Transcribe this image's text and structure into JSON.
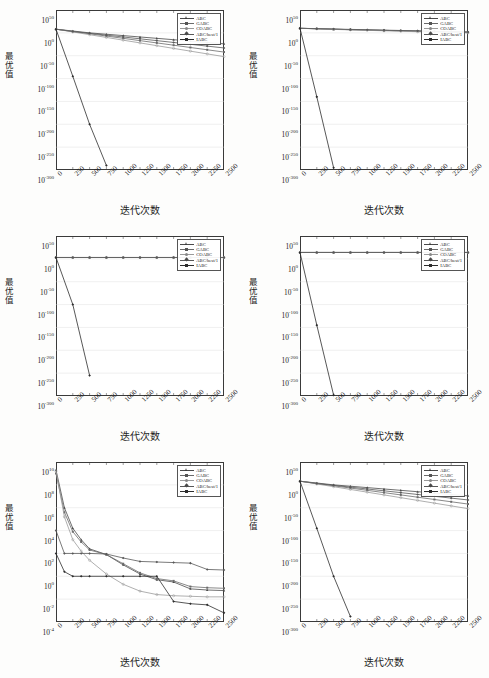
{
  "figure": {
    "axis_labels": {
      "x": "迭代次数",
      "y": "最优值"
    },
    "legend_entries": [
      "ABC",
      "GABC",
      "COABC",
      "ABC/best/1",
      "IABC"
    ],
    "x_ticks": [
      "0",
      "250",
      "500",
      "750",
      "1000",
      "1250",
      "1500",
      "1750",
      "2000",
      "2250",
      "2500"
    ],
    "y_ticks_wide": [
      "10",
      "10",
      "10",
      "10",
      "10",
      "10",
      "10",
      "10"
    ],
    "y_exponents_wide": [
      "50",
      "0",
      "-50",
      "-100",
      "-150",
      "-200",
      "-250",
      "-300"
    ],
    "y_ticks_narrow": [
      "10",
      "10",
      "10",
      "10",
      "10",
      "10",
      "10",
      "10"
    ],
    "y_exponents_narrow": [
      "10",
      "8",
      "6",
      "4",
      "2",
      "0",
      "-2",
      "-4"
    ]
  },
  "chart_data": [
    {
      "type": "line",
      "panel": "top-left",
      "title": "",
      "xlabel": "迭代次数",
      "ylabel": "最优值",
      "xlim": [
        0,
        2500
      ],
      "ylim_log10": [
        -300,
        50
      ],
      "x": [
        0,
        250,
        500,
        750,
        1000,
        1250,
        1500,
        1750,
        2000,
        2250,
        2500
      ],
      "series": [
        {
          "name": "ABC",
          "log10_values": [
            8,
            4,
            0,
            -3,
            -6,
            -9,
            -12,
            -15,
            -18,
            -21,
            -24
          ]
        },
        {
          "name": "GABC",
          "log10_values": [
            8,
            3,
            -2,
            -7,
            -12,
            -17,
            -22,
            -27,
            -32,
            -37,
            -42
          ]
        },
        {
          "name": "COABC",
          "log10_values": [
            8,
            2,
            -4,
            -10,
            -16,
            -22,
            -28,
            -34,
            -40,
            -46,
            -52
          ]
        },
        {
          "name": "ABC/best/1",
          "log10_values": [
            8,
            3,
            -1,
            -5,
            -9,
            -13,
            -17,
            -21,
            -25,
            -29,
            -33
          ]
        },
        {
          "name": "IABC",
          "log10_values": [
            8,
            -95,
            -200,
            -290,
            null,
            null,
            null,
            null,
            null,
            null,
            null
          ]
        }
      ]
    },
    {
      "type": "line",
      "panel": "top-right",
      "title": "",
      "xlabel": "迭代次数",
      "ylabel": "最优值",
      "xlim": [
        0,
        2500
      ],
      "ylim_log10": [
        -300,
        50
      ],
      "x": [
        0,
        250,
        500,
        750,
        1000,
        1250,
        1500,
        1750,
        2000,
        2250,
        2500
      ],
      "series": [
        {
          "name": "ABC",
          "log10_values": [
            10,
            9,
            8,
            7,
            6.2,
            5.4,
            4.6,
            3.8,
            3.0,
            2.2,
            1.4
          ]
        },
        {
          "name": "GABC",
          "log10_values": [
            10,
            9,
            8,
            7,
            6.2,
            5.4,
            4.6,
            3.8,
            3.0,
            2.2,
            1.4
          ]
        },
        {
          "name": "COABC",
          "log10_values": [
            10,
            8.8,
            7.6,
            6.5,
            5.5,
            4.5,
            3.5,
            2.5,
            1.6,
            0.8,
            0.0
          ]
        },
        {
          "name": "ABC/best/1",
          "log10_values": [
            10,
            9.2,
            8.4,
            7.6,
            6.8,
            6.0,
            5.2,
            4.4,
            3.6,
            2.8,
            2.0
          ]
        },
        {
          "name": "IABC",
          "log10_values": [
            10,
            -140,
            -295,
            null,
            null,
            null,
            null,
            null,
            null,
            null,
            null
          ]
        }
      ]
    },
    {
      "type": "line",
      "panel": "middle-left",
      "title": "",
      "xlabel": "迭代次数",
      "ylabel": "最优值",
      "xlim": [
        0,
        2500
      ],
      "ylim_log10": [
        -300,
        50
      ],
      "x": [
        0,
        250,
        500,
        750,
        1000,
        1250,
        1500,
        1750,
        2000,
        2250,
        2500
      ],
      "series": [
        {
          "name": "ABC",
          "log10_values": [
            3,
            3,
            3,
            3,
            3,
            3,
            3,
            3,
            3,
            3,
            3
          ]
        },
        {
          "name": "GABC",
          "log10_values": [
            3,
            3,
            3,
            3,
            3,
            3,
            3,
            3,
            3,
            3,
            3
          ]
        },
        {
          "name": "COABC",
          "log10_values": [
            3,
            3,
            3,
            3,
            3,
            3,
            3,
            3,
            3,
            3,
            3
          ]
        },
        {
          "name": "ABC/best/1",
          "log10_values": [
            3,
            3,
            3,
            3,
            3,
            3,
            3,
            3,
            3,
            3,
            3
          ]
        },
        {
          "name": "IABC",
          "log10_values": [
            3,
            -100,
            -255,
            null,
            null,
            null,
            null,
            null,
            null,
            null,
            null
          ]
        }
      ]
    },
    {
      "type": "line",
      "panel": "middle-right",
      "title": "",
      "xlabel": "迭代次数",
      "ylabel": "最优值",
      "xlim": [
        0,
        2500
      ],
      "ylim_log10": [
        -300,
        50
      ],
      "x": [
        0,
        250,
        500,
        750,
        1000,
        1250,
        1500,
        1750,
        2000,
        2250,
        2500
      ],
      "series": [
        {
          "name": "ABC",
          "log10_values": [
            14,
            14,
            14,
            14,
            14,
            14,
            14,
            14,
            14,
            14,
            14
          ]
        },
        {
          "name": "GABC",
          "log10_values": [
            14,
            14,
            14,
            14,
            14,
            14,
            14,
            14,
            14,
            14,
            14
          ]
        },
        {
          "name": "COABC",
          "log10_values": [
            14,
            14,
            14,
            14,
            14,
            14,
            14,
            14,
            14,
            14,
            14
          ]
        },
        {
          "name": "ABC/best/1",
          "log10_values": [
            14,
            14,
            14,
            14,
            14,
            14,
            14,
            14,
            14,
            14,
            14
          ]
        },
        {
          "name": "IABC",
          "log10_values": [
            14,
            -145,
            -298,
            null,
            null,
            null,
            null,
            null,
            null,
            null,
            null
          ]
        }
      ]
    },
    {
      "type": "line",
      "panel": "bottom-left",
      "title": "",
      "xlabel": "迭代次数",
      "ylabel": "最优值",
      "xlim": [
        0,
        2500
      ],
      "ylim_log10": [
        -4,
        10
      ],
      "x": [
        0,
        125,
        250,
        375,
        500,
        750,
        1000,
        1250,
        1500,
        1750,
        2000,
        2250,
        2500
      ],
      "series": [
        {
          "name": "ABC",
          "log10_values": [
            9.3,
            6.0,
            4.2,
            3.2,
            2.4,
            1.9,
            1.0,
            0.2,
            -0.3,
            -0.5,
            -1.1,
            -1.2,
            -1.25
          ]
        },
        {
          "name": "GABC",
          "log10_values": [
            9.0,
            5.6,
            3.9,
            3.0,
            2.3,
            1.9,
            1.1,
            0.3,
            -0.2,
            -0.4,
            -0.9,
            -1.0,
            -1.05
          ]
        },
        {
          "name": "COABC",
          "log10_values": [
            9.2,
            5.2,
            3.2,
            2.2,
            1.4,
            0.2,
            -0.7,
            -1.3,
            -1.6,
            -1.7,
            -1.75,
            -1.8,
            -1.8
          ]
        },
        {
          "name": "ABC/best/1",
          "log10_values": [
            4.0,
            2.0,
            2.0,
            2.0,
            2.0,
            1.95,
            1.6,
            1.3,
            1.25,
            1.2,
            1.15,
            0.6,
            0.55
          ]
        },
        {
          "name": "IABC",
          "log10_values": [
            2.0,
            0.4,
            0.0,
            0.0,
            0.0,
            0.0,
            0.0,
            0.0,
            0.0,
            -2.2,
            -2.4,
            -2.5,
            -3.2
          ]
        }
      ]
    },
    {
      "type": "line",
      "panel": "bottom-right",
      "title": "",
      "xlabel": "迭代次数",
      "ylabel": "最优值",
      "xlim": [
        0,
        2500
      ],
      "ylim_log10": [
        -300,
        50
      ],
      "x": [
        0,
        250,
        500,
        750,
        1000,
        1250,
        1500,
        1750,
        2000,
        2250,
        2500
      ],
      "series": [
        {
          "name": "ABC",
          "log10_values": [
            8,
            4,
            0,
            -3,
            -6,
            -9,
            -12,
            -15,
            -18,
            -21,
            -24
          ]
        },
        {
          "name": "GABC",
          "log10_values": [
            8,
            3,
            -2,
            -7,
            -12,
            -17,
            -22,
            -27,
            -32,
            -37,
            -42
          ]
        },
        {
          "name": "COABC",
          "log10_values": [
            8,
            2,
            -4,
            -10,
            -16,
            -22,
            -28,
            -34,
            -40,
            -46,
            -52
          ]
        },
        {
          "name": "ABC/best/1",
          "log10_values": [
            8,
            3,
            -1,
            -5,
            -9,
            -13,
            -17,
            -21,
            -25,
            -29,
            -33
          ]
        },
        {
          "name": "IABC",
          "log10_values": [
            8,
            -95,
            -200,
            -288,
            null,
            null,
            null,
            null,
            null,
            null,
            null
          ]
        }
      ]
    }
  ],
  "colors": {
    "series": [
      "#4a4a4a",
      "#6b6b6b",
      "#9a9a9a",
      "#585858",
      "#2d2d2d"
    ],
    "axis": "#3a3a3a",
    "grid": "#d9d9d9",
    "background": "#ffffff"
  }
}
